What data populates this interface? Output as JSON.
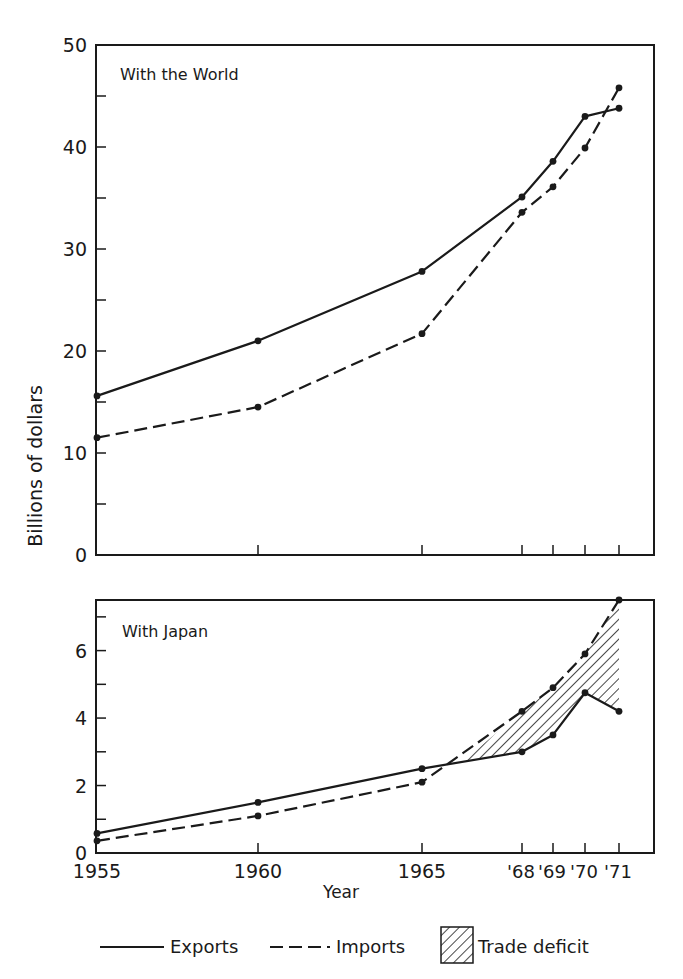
{
  "chart_data": [
    {
      "type": "line",
      "title": "With the World",
      "xlabel": "",
      "ylabel": "Billions of dollars",
      "x": [
        1955,
        1960,
        1965,
        1968,
        1969,
        1970,
        1971
      ],
      "xlim": [
        1955,
        1972.1
      ],
      "ylim": [
        0,
        50
      ],
      "yticks": [
        0,
        10,
        20,
        30,
        40,
        50
      ],
      "yminor": [
        5,
        15,
        25,
        35,
        45
      ],
      "grid": false,
      "series": [
        {
          "name": "Exports",
          "style": "solid",
          "values": [
            15.6,
            21.0,
            27.8,
            35.1,
            38.6,
            43.0,
            43.8
          ]
        },
        {
          "name": "Imports",
          "style": "dashed",
          "values": [
            11.5,
            14.5,
            21.7,
            33.6,
            36.1,
            39.9,
            45.8
          ]
        }
      ]
    },
    {
      "type": "area",
      "title": "With Japan",
      "xlabel": "Year",
      "ylabel": "Billions of dollars",
      "x": [
        1955,
        1960,
        1965,
        1968,
        1969,
        1970,
        1971
      ],
      "xlim": [
        1955,
        1972.1
      ],
      "ylim": [
        0,
        7.5
      ],
      "yticks": [
        0,
        2,
        4,
        6
      ],
      "yminor": [
        1,
        3,
        5,
        7
      ],
      "grid": false,
      "series": [
        {
          "name": "Exports",
          "style": "solid",
          "values": [
            0.58,
            1.5,
            2.5,
            3.0,
            3.5,
            4.75,
            4.2
          ]
        },
        {
          "name": "Imports",
          "style": "dashed",
          "values": [
            0.36,
            1.1,
            2.1,
            4.2,
            4.9,
            5.9,
            7.5
          ]
        }
      ],
      "shaded_region": {
        "name": "Trade deficit",
        "from_year": 1966.2,
        "to_year": 1971,
        "between": [
          "Exports",
          "Imports"
        ]
      }
    }
  ],
  "x_tick_labels": [
    "1955",
    "1960",
    "1965",
    "'68",
    "'69",
    "'70",
    "'71"
  ],
  "ylabel": "Billions of dollars",
  "xlabel": "Year",
  "panels": {
    "world": {
      "label": "With the World"
    },
    "japan": {
      "label": "With Japan"
    }
  },
  "legend": {
    "exports": "Exports",
    "imports": "Imports",
    "deficit": "Trade deficit"
  },
  "colors": {
    "ink": "#1a1a1a",
    "background": "#ffffff"
  }
}
